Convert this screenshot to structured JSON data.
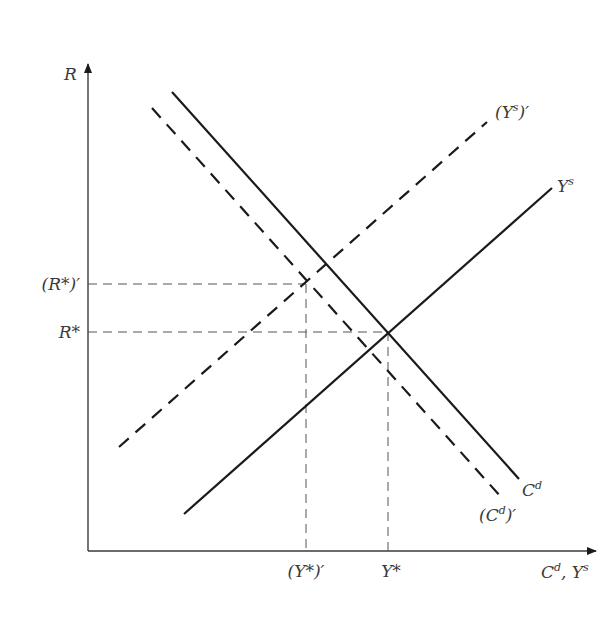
{
  "diagram": {
    "colors": {
      "axis": "#3a3a3a",
      "line": "#1a1a1a",
      "guide": "#555555",
      "text": "#3a3a3a",
      "background": "#ffffff"
    },
    "axes": {
      "y_label": "R",
      "x_label_main": "C",
      "x_label_main_sup": "d",
      "x_label_sep": ", Y",
      "x_label_sep_sup": "s"
    },
    "curves": [
      {
        "id": "cd",
        "name": "C^d",
        "label_base": "C",
        "label_sup": "d",
        "style": "solid"
      },
      {
        "id": "cd-prime",
        "name": "(C^d)'",
        "label_open": "(C",
        "label_sup": "d",
        "label_close": ")′",
        "style": "dashed"
      },
      {
        "id": "ys",
        "name": "Y^s",
        "label_base": "Y",
        "label_sup": "s",
        "style": "solid"
      },
      {
        "id": "ys-prime",
        "name": "(Y^s)'",
        "label_open": "(Y",
        "label_sup": "s",
        "label_close": ")′",
        "style": "dashed"
      }
    ],
    "y_ticks": [
      {
        "id": "r-star-prime",
        "label": "(R*)′"
      },
      {
        "id": "r-star",
        "label": "R*"
      }
    ],
    "x_ticks": [
      {
        "id": "y-star-prime",
        "label": "(Y*)′"
      },
      {
        "id": "y-star",
        "label": "Y*"
      }
    ],
    "equilibria": [
      {
        "id": "original",
        "description": "Intersection of C^d and Y^s at (Y*, R*)"
      },
      {
        "id": "new",
        "description": "Intersection of (C^d)' and (Y^s)' at ((Y*)', (R*)')"
      }
    ]
  }
}
